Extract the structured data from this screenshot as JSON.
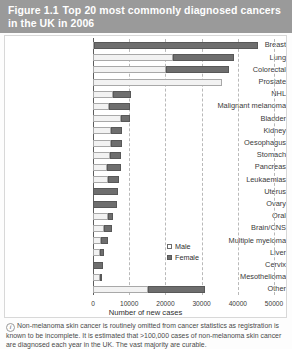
{
  "header": {
    "figure_number": "Figure 1.1",
    "title": "Top 20 most commonly diagnosed cancers in the UK in 2006"
  },
  "legend": {
    "position": "inside-right",
    "male_label": "Male",
    "female_label": "Female"
  },
  "footnote": {
    "icon": "info-icon",
    "icon_glyph": "i",
    "text": "Non-melanoma skin cancer is routinely omitted from cancer statistics as registration is known to be incomplete. It is estimated that >100,000 cases of non-melanoma skin cancer are diagnosed each year in the UK. The vast majority are curable."
  },
  "colors": {
    "header_background": "#9a9a9a",
    "header_text": "#ffffff",
    "male_bar": "#f2f2f2",
    "female_bar": "#6e6e6e",
    "gridline": "#b9b9b9",
    "axis": "#5d5d5d"
  },
  "chart_data": {
    "type": "bar",
    "orientation": "horizontal",
    "stacked": true,
    "title": "Top 20 most commonly diagnosed cancers in the UK in 2006",
    "xlabel": "Number of new cases",
    "ylabel": "",
    "xlim": [
      0,
      50000
    ],
    "xticks": [
      0,
      10000,
      20000,
      30000,
      40000,
      50000
    ],
    "xtick_labels": [
      "0",
      "10000",
      "20000",
      "30000",
      "40000",
      "50000"
    ],
    "grid": true,
    "legend": [
      "Male",
      "Female"
    ],
    "categories": [
      "Breast",
      "Lung",
      "Colorectal",
      "Prostate",
      "NHL",
      "Malignant melanoma",
      "Bladder",
      "Kidney",
      "Oesophagus",
      "Stomach",
      "Pancreas",
      "Leukaemias",
      "Uterus",
      "Ovary",
      "Oral",
      "Brain/CNS",
      "Multiple myeloma",
      "Liver",
      "Cervix",
      "Mesothelioma",
      "Other"
    ],
    "series": [
      {
        "name": "Male",
        "values": [
          300,
          22000,
          20200,
          35500,
          5500,
          4300,
          7600,
          5000,
          5100,
          4700,
          3800,
          4200,
          0,
          0,
          4200,
          3000,
          2300,
          1800,
          0,
          1900,
          15200
        ]
      },
      {
        "name": "Female",
        "values": [
          45200,
          17000,
          17300,
          0,
          4900,
          5900,
          2600,
          2900,
          2800,
          3000,
          3900,
          2900,
          7000,
          6600,
          1300,
          2300,
          1800,
          1300,
          2800,
          400,
          15800
        ]
      }
    ],
    "totals": [
      45500,
      39000,
      37500,
      35500,
      10400,
      10200,
      10200,
      7900,
      7900,
      7700,
      7700,
      7100,
      7000,
      6600,
      5500,
      5300,
      4100,
      3100,
      2800,
      2300,
      31000
    ]
  }
}
